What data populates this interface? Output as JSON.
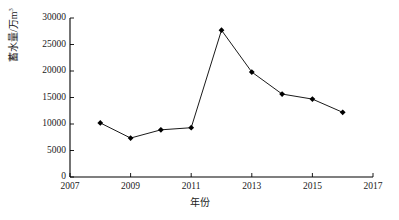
{
  "chart_data": {
    "type": "line",
    "title": "",
    "xlabel": "年份",
    "ylabel": "蓄水量/万m³",
    "ylabel_base": "蓄水量/万m",
    "ylabel_sup": "3",
    "xlim": [
      2007,
      2017
    ],
    "ylim": [
      0,
      30000
    ],
    "grid": false,
    "legend": null,
    "x": [
      2008,
      2009,
      2010,
      2011,
      2012,
      2013,
      2014,
      2015,
      2016
    ],
    "values": [
      10200,
      7350,
      8900,
      9300,
      27700,
      19800,
      15650,
      14700,
      12200
    ],
    "xticks": [
      "2007",
      "2009",
      "2011",
      "2013",
      "2015",
      "2017"
    ],
    "xtick_values": [
      2007,
      2009,
      2011,
      2013,
      2015,
      2017
    ],
    "yticks": [
      "0",
      "5000",
      "10000",
      "15000",
      "20000",
      "25000",
      "30000"
    ],
    "ytick_values": [
      0,
      5000,
      10000,
      15000,
      20000,
      25000,
      30000
    ],
    "series_color": "#000000",
    "marker": "diamond",
    "axis_color": "#000000"
  }
}
